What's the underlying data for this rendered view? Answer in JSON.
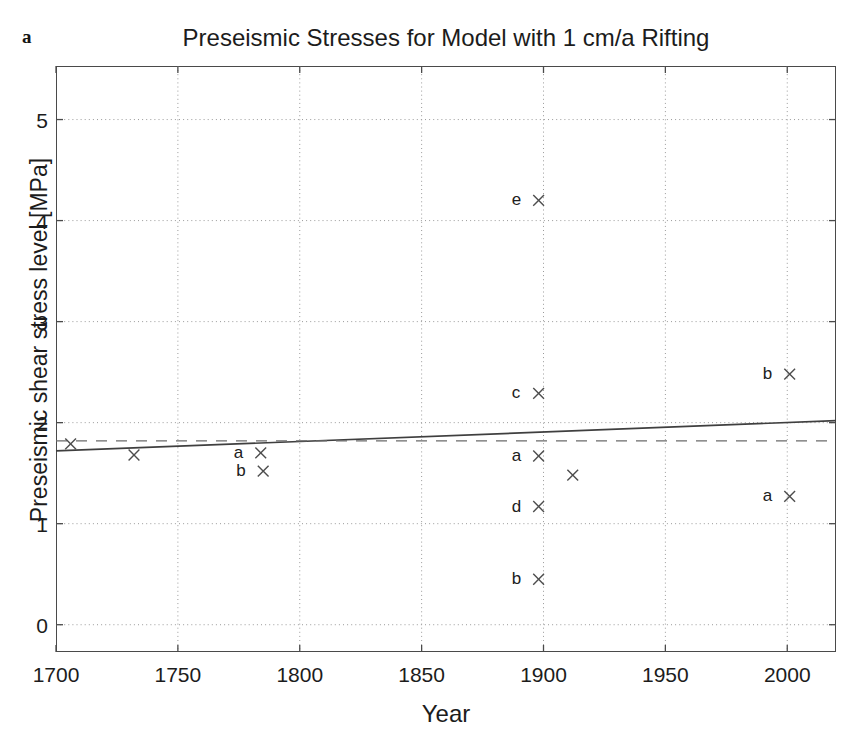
{
  "figure": {
    "panel_label": "a",
    "title": "Preseismic Stresses for Model with 1 cm/a Rifting"
  },
  "axes": {
    "xlabel": "Year",
    "ylabel": "Preseismic shear stress level [MPa]",
    "xticks": [
      "1700",
      "1750",
      "1800",
      "1850",
      "1900",
      "1950",
      "2000"
    ],
    "yticks": [
      "0",
      "1",
      "2",
      "3",
      "4",
      "5"
    ]
  },
  "colors": {
    "axis": "#4a4a4a",
    "grid": "#9a9a9a",
    "marker": "#4d4d4d",
    "trend_line": "#3f3f3f",
    "mean_line": "#6b6b6b",
    "text": "#1c1c1c"
  },
  "chart_data": {
    "type": "scatter",
    "title": "Preseismic Stresses for Model with 1 cm/a Rifting",
    "xlabel": "Year",
    "ylabel": "Preseismic shear stress level [MPa]",
    "xlim": [
      1700,
      2020
    ],
    "ylim": [
      -0.27,
      5.53
    ],
    "xticks": [
      1700,
      1750,
      1800,
      1850,
      1900,
      1950,
      2000
    ],
    "yticks": [
      0,
      1,
      2,
      3,
      4,
      5
    ],
    "grid": true,
    "legend": "none",
    "marker_symbol": "x",
    "points": [
      {
        "label": "",
        "x": 1706,
        "y": 1.79
      },
      {
        "label": "",
        "x": 1732,
        "y": 1.68
      },
      {
        "label": "a",
        "x": 1784,
        "y": 1.7
      },
      {
        "label": "b",
        "x": 1785,
        "y": 1.52
      },
      {
        "label": "e",
        "x": 1898,
        "y": 4.2
      },
      {
        "label": "c",
        "x": 1898,
        "y": 2.29
      },
      {
        "label": "a",
        "x": 1898,
        "y": 1.67
      },
      {
        "label": "d",
        "x": 1898,
        "y": 1.17
      },
      {
        "label": "b",
        "x": 1898,
        "y": 0.45
      },
      {
        "label": "",
        "x": 1912,
        "y": 1.48
      },
      {
        "label": "b",
        "x": 2001,
        "y": 2.48
      },
      {
        "label": "a",
        "x": 2001,
        "y": 1.27
      }
    ],
    "lines": [
      {
        "name": "trend-line",
        "style": "solid",
        "x": [
          1700,
          2020
        ],
        "y": [
          1.72,
          2.02
        ]
      },
      {
        "name": "mean-line",
        "style": "dashed",
        "x": [
          1700,
          2020
        ],
        "y": [
          1.82,
          1.82
        ]
      }
    ]
  }
}
